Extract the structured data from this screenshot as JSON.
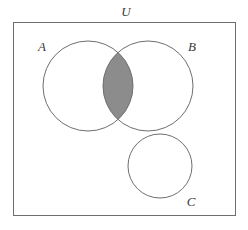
{
  "figure": {
    "type": "venn-diagram",
    "title": "",
    "background_color": "#ffffff",
    "universe": {
      "label": "U",
      "frame": {
        "x": 13,
        "y": 22,
        "width": 223,
        "height": 194,
        "stroke_color": "#6e6e6e",
        "fill_color": "#ffffff",
        "stroke_width": 1
      },
      "label_position": {
        "x": 126,
        "y": 16
      }
    },
    "sets": [
      {
        "label": "A",
        "cx": 88,
        "cy": 86,
        "r": 45,
        "stroke_color": "#6e6e6e",
        "fill_color": "none",
        "label_x": 42,
        "label_y": 51
      },
      {
        "label": "B",
        "cx": 148,
        "cy": 86,
        "r": 45,
        "stroke_color": "#6e6e6e",
        "fill_color": "none",
        "label_x": 192,
        "label_y": 51
      },
      {
        "label": "C",
        "cx": 160,
        "cy": 166,
        "r": 32,
        "stroke_color": "#6e6e6e",
        "fill_color": "none",
        "label_x": 191,
        "label_y": 206
      }
    ],
    "shaded_regions": [
      {
        "name": "A-intersect-B",
        "description": "lens-shaped overlap of circle A and circle B",
        "fill_color": "#8c8c8c",
        "stroke_color": "#6e6e6e"
      }
    ],
    "legend": [],
    "annotations": []
  }
}
